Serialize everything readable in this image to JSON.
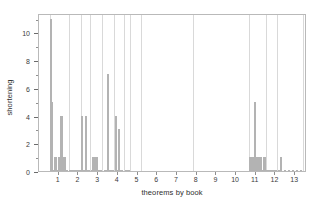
{
  "chart_data": {
    "type": "bar",
    "title": "",
    "xlabel": "theorems by book",
    "ylabel": "shortening",
    "xlim": [
      0,
      13.6
    ],
    "ylim": [
      0,
      11.4
    ],
    "grid": "vertical-major-only",
    "legend": "none",
    "bar_color": "#b3b3b3",
    "frame_color": "#b9b9b9",
    "gridline_color": "#d9d9d9",
    "xticks": [
      1,
      2,
      3,
      4,
      5,
      6,
      7,
      8,
      9,
      10,
      11,
      12,
      13
    ],
    "xticklabels": [
      "1",
      "2",
      "3",
      "4",
      "5",
      "6",
      "7",
      "8",
      "9",
      "10",
      "11",
      "12",
      "13"
    ],
    "yticks": [
      0,
      2,
      4,
      6,
      8,
      10
    ],
    "yticklabels": [
      "0",
      "2",
      "4",
      "6",
      "8",
      "10"
    ],
    "yminorticks": [
      1,
      3,
      5,
      7,
      9,
      11
    ],
    "book_boundaries": [
      0.56,
      1.52,
      2.12,
      2.6,
      3.22,
      3.82,
      4.3,
      4.64,
      5.2,
      7.8,
      10.64,
      11.5,
      12.08,
      13.4
    ],
    "x": [
      0.6,
      0.66,
      0.72,
      0.78,
      0.84,
      0.9,
      0.96,
      1.02,
      1.08,
      1.14,
      1.2,
      1.26,
      1.32,
      1.38,
      1.44,
      1.58,
      1.64,
      1.7,
      1.76,
      1.82,
      1.88,
      1.94,
      2.0,
      2.06,
      2.2,
      2.3,
      2.38,
      2.46,
      2.54,
      2.68,
      2.76,
      2.84,
      2.92,
      3.0,
      3.08,
      3.16,
      3.36,
      3.44,
      3.52,
      3.6,
      3.68,
      3.76,
      3.9,
      3.98,
      4.06,
      4.14,
      4.22,
      4.4,
      4.48,
      4.56,
      10.72,
      10.8,
      10.88,
      10.96,
      11.04,
      11.12,
      11.2,
      11.28,
      11.36,
      11.44,
      11.6,
      11.7,
      11.8,
      11.9,
      12.0,
      12.16,
      12.3,
      12.5,
      12.7,
      12.9,
      13.1,
      13.3
    ],
    "values": [
      11.0,
      5.0,
      0.0,
      0.0,
      1.0,
      0.0,
      0.0,
      1.0,
      1.0,
      4.0,
      1.0,
      0.0,
      1.0,
      0.0,
      0.0,
      0.0,
      0.0,
      0.0,
      0.0,
      0.0,
      0.0,
      0.0,
      0.0,
      0.0,
      4.0,
      0.0,
      4.0,
      0.0,
      0.0,
      0.0,
      1.0,
      1.0,
      1.0,
      0.0,
      0.0,
      0.0,
      0.0,
      0.0,
      7.0,
      0.0,
      0.0,
      0.0,
      4.0,
      0.0,
      3.0,
      0.0,
      0.0,
      0.0,
      0.0,
      0.0,
      1.0,
      1.0,
      1.0,
      5.0,
      1.0,
      1.0,
      1.0,
      1.0,
      0.0,
      1.0,
      0.0,
      0.0,
      0.0,
      0.0,
      0.0,
      0.0,
      1.0,
      0.0,
      0.0,
      0.0,
      0.0,
      0.0
    ]
  }
}
